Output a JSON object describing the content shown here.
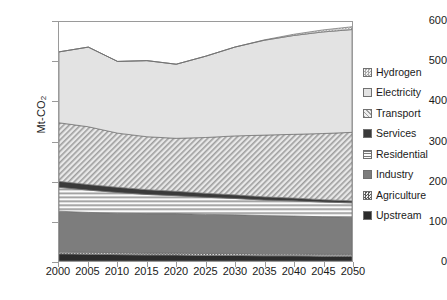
{
  "chart_data": {
    "type": "area",
    "title": "",
    "xlabel": "",
    "ylabel": "Mt-CO2",
    "ylabel_display": "Mt-CO",
    "ylabel_sub": "2",
    "x": [
      2000,
      2005,
      2010,
      2015,
      2020,
      2025,
      2030,
      2035,
      2040,
      2045,
      2050
    ],
    "xticks": [
      "2000",
      "2005",
      "2010",
      "2015",
      "2020",
      "2025",
      "2030",
      "2035",
      "2040",
      "2045",
      "2050"
    ],
    "yticks": [
      "0",
      "100",
      "200",
      "300",
      "400",
      "500",
      "600"
    ],
    "ylim": [
      0,
      600
    ],
    "xlim": [
      2000,
      2050
    ],
    "grid": false,
    "legend_position": "right",
    "stacked": true,
    "stack_order_bottom_to_top": [
      "Upstream",
      "Agriculture",
      "Industry",
      "Residential",
      "Services",
      "Transport",
      "Electricity",
      "Hydrogen"
    ],
    "series": [
      {
        "name": "Upstream",
        "pattern": "solid-dark",
        "color": "#2b2b2b",
        "values": [
          18,
          17,
          16,
          15,
          15,
          14,
          14,
          13,
          13,
          12,
          12
        ]
      },
      {
        "name": "Agriculture",
        "pattern": "checker",
        "color": "#8e8e8e",
        "values": [
          5,
          5,
          5,
          5,
          5,
          5,
          5,
          5,
          5,
          5,
          5
        ]
      },
      {
        "name": "Industry",
        "pattern": "solid-medium",
        "color": "#7d7d7d",
        "values": [
          102,
          100,
          99,
          99,
          99,
          98,
          97,
          96,
          95,
          94,
          93
        ]
      },
      {
        "name": "Residential",
        "pattern": "horizontal-lines",
        "color": "#eeeeee",
        "values": [
          60,
          56,
          52,
          48,
          45,
          43,
          41,
          39,
          38,
          37,
          36
        ]
      },
      {
        "name": "Services",
        "pattern": "solid-verydark",
        "color": "#3a3a3a",
        "values": [
          15,
          14,
          13,
          12,
          11,
          10,
          9,
          8,
          7,
          6,
          5
        ]
      },
      {
        "name": "Transport",
        "pattern": "diagonal-hatch",
        "color": "#d0d0d0",
        "values": [
          147,
          145,
          136,
          133,
          133,
          140,
          148,
          155,
          160,
          166,
          172
        ]
      },
      {
        "name": "Electricity",
        "pattern": "solid-light",
        "color": "#e3e3e3",
        "values": [
          178,
          200,
          180,
          191,
          186,
          204,
          223,
          238,
          248,
          255,
          258
        ]
      },
      {
        "name": "Hydrogen",
        "pattern": "light-checker",
        "color": "#cfcfcf",
        "values": [
          0,
          0,
          0,
          0,
          0,
          0,
          0,
          1,
          3,
          5,
          7
        ]
      }
    ],
    "totals": [
      525,
      537,
      501,
      503,
      494,
      514,
      537,
      555,
      569,
      580,
      588
    ]
  },
  "legend": {
    "items": [
      {
        "label": "Hydrogen"
      },
      {
        "label": "Electricity"
      },
      {
        "label": "Transport"
      },
      {
        "label": "Services"
      },
      {
        "label": "Residential"
      },
      {
        "label": "Industry"
      },
      {
        "label": "Agriculture"
      },
      {
        "label": "Upstream"
      }
    ]
  }
}
